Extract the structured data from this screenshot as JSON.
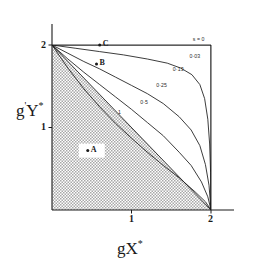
{
  "figure": {
    "background": "#ffffff",
    "ink_color": "#1a1a1a",
    "shade_color": "#b9b9b9"
  },
  "axes": {
    "x_title": "gX",
    "x_title_sup": "*",
    "y_title_prefix": "g",
    "y_title_sup1": "'",
    "y_title_main": "Y",
    "y_title_sup2": "*",
    "x_ticks": [
      {
        "label": "1",
        "value": 1
      },
      {
        "label": "2",
        "value": 2
      }
    ],
    "y_ticks": [
      {
        "label": "1",
        "value": 1
      },
      {
        "label": "2",
        "value": 2
      }
    ],
    "xlim": [
      0,
      2
    ],
    "ylim": [
      0,
      2
    ]
  },
  "points": [
    {
      "name": "A",
      "label": "A",
      "x": 0.45,
      "y": 0.72,
      "marker": "dot",
      "knockout": true
    },
    {
      "name": "B",
      "label": "B",
      "x": 0.56,
      "y": 1.77,
      "marker": "dot",
      "knockout": false
    },
    {
      "name": "C",
      "label": "C",
      "x": 0.6,
      "y": 2.0,
      "marker": "dot",
      "knockout": false
    }
  ],
  "chart_data": {
    "type": "line",
    "title": "",
    "xlabel": "gX*",
    "ylabel": "g'Y*",
    "xlim": [
      0,
      2
    ],
    "ylim": [
      0,
      2
    ],
    "grid": false,
    "legend": "inline-curve-labels",
    "shaded_region": {
      "description": "stippled region below the straight diagonal from (0,2) to (2,0)",
      "vertices": [
        [
          0,
          0
        ],
        [
          0,
          2
        ],
        [
          2,
          0
        ]
      ]
    },
    "series": [
      {
        "name": "s = 1",
        "label": "1",
        "label_x": 0.83,
        "label_y": 1.17,
        "points": [
          [
            0,
            2
          ],
          [
            2,
            0
          ]
        ]
      },
      {
        "name": "s = 0.5",
        "label": "0·5",
        "label_x": 1.11,
        "label_y": 1.3,
        "points": [
          [
            0,
            2
          ],
          [
            0.2,
            1.72
          ],
          [
            0.4,
            1.47
          ],
          [
            0.6,
            1.25
          ],
          [
            0.8,
            1.05
          ],
          [
            1.0,
            0.87
          ],
          [
            1.2,
            0.7
          ],
          [
            1.4,
            0.54
          ],
          [
            1.6,
            0.39
          ],
          [
            1.8,
            0.22
          ],
          [
            1.93,
            0.1
          ],
          [
            2,
            0
          ]
        ]
      },
      {
        "name": "s = 0.25",
        "label": "0·25",
        "label_x": 1.31,
        "label_y": 1.5,
        "points": [
          [
            0,
            2
          ],
          [
            0.2,
            1.83
          ],
          [
            0.4,
            1.67
          ],
          [
            0.6,
            1.52
          ],
          [
            0.8,
            1.37
          ],
          [
            1.0,
            1.22
          ],
          [
            1.2,
            1.06
          ],
          [
            1.4,
            0.9
          ],
          [
            1.6,
            0.7
          ],
          [
            1.75,
            0.54
          ],
          [
            1.88,
            0.34
          ],
          [
            1.96,
            0.16
          ],
          [
            2,
            0
          ]
        ]
      },
      {
        "name": "s = 0.13",
        "label": "0·13",
        "label_x": 1.52,
        "label_y": 1.7,
        "points": [
          [
            0,
            2
          ],
          [
            0.2,
            1.9
          ],
          [
            0.4,
            1.8
          ],
          [
            0.6,
            1.71
          ],
          [
            0.8,
            1.61
          ],
          [
            1.0,
            1.51
          ],
          [
            1.2,
            1.41
          ],
          [
            1.4,
            1.29
          ],
          [
            1.6,
            1.13
          ],
          [
            1.75,
            0.97
          ],
          [
            1.86,
            0.78
          ],
          [
            1.93,
            0.55
          ],
          [
            1.975,
            0.3
          ],
          [
            2,
            0
          ]
        ]
      },
      {
        "name": "s = 0.03",
        "label": "0·03",
        "label_x": 1.73,
        "label_y": 1.86,
        "points": [
          [
            0,
            2
          ],
          [
            0.3,
            1.96
          ],
          [
            0.6,
            1.92
          ],
          [
            0.9,
            1.88
          ],
          [
            1.2,
            1.83
          ],
          [
            1.45,
            1.78
          ],
          [
            1.62,
            1.72
          ],
          [
            1.76,
            1.64
          ],
          [
            1.86,
            1.52
          ],
          [
            1.92,
            1.35
          ],
          [
            1.96,
            1.1
          ],
          [
            1.983,
            0.8
          ],
          [
            1.995,
            0.45
          ],
          [
            2,
            0
          ]
        ]
      },
      {
        "name": "s = 0",
        "label": "s = 0",
        "label_x": 1.77,
        "label_y": 2.06,
        "points": [
          [
            0,
            2
          ],
          [
            2,
            2
          ],
          [
            2,
            0
          ]
        ]
      }
    ]
  }
}
